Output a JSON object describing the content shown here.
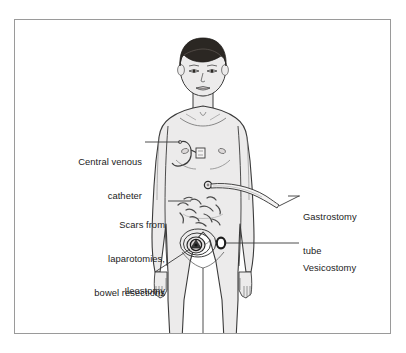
{
  "figure": {
    "background_color": "#ffffff",
    "frame_color": "#9a9a9a",
    "skin_color": "#ecebeb",
    "outline_color": "#3a3a3a",
    "hair_color": "#2b2723",
    "text_color": "#1c1c1c"
  },
  "labels": {
    "central_venous_catheter": {
      "line1": "Central venous",
      "line2": "catheter",
      "align": "right"
    },
    "scars": {
      "line1": "Scars from",
      "line2": "laparotomies,",
      "line3": "bowel resections",
      "align": "right"
    },
    "ileostomy": {
      "line1": "Ileostomy",
      "align": "right"
    },
    "gastrostomy_tube": {
      "line1": "Gastrostomy",
      "line2": "tube",
      "align": "left"
    },
    "vesicostomy": {
      "line1": "Vesicostomy",
      "align": "left"
    }
  }
}
